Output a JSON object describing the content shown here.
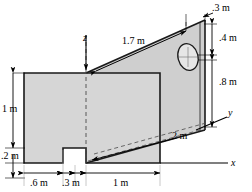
{
  "figure": {
    "type": "engineering-isometric-drawing",
    "colors": {
      "outline": "#1a1a1a",
      "face_fill": "#d5d5d5",
      "face_fill_right": "#cfcfcf",
      "background": "#ffffff",
      "dimension_line": "#000000"
    },
    "axes": [
      {
        "name": "x",
        "label": "x"
      },
      {
        "name": "y",
        "label": "y"
      },
      {
        "name": "z",
        "label": "z"
      }
    ],
    "dimensions": [
      {
        "id": "d-03-top",
        "label": ".3 m",
        "position": "top-right"
      },
      {
        "id": "d-04",
        "label": ".4 m",
        "position": "right-upper"
      },
      {
        "id": "d-08",
        "label": ".8 m",
        "position": "right-lower"
      },
      {
        "id": "d-17",
        "label": "1.7 m",
        "position": "top-slant"
      },
      {
        "id": "d-2",
        "label": "2 m",
        "position": "bottom-slant"
      },
      {
        "id": "d-1-vert",
        "label": "1 m",
        "position": "left-vertical"
      },
      {
        "id": "d-02",
        "label": ".2 m",
        "position": "left-bottom"
      },
      {
        "id": "d-06",
        "label": ".6 m",
        "position": "bottom-left"
      },
      {
        "id": "d-03-bottom",
        "label": ".3 m",
        "position": "bottom-middle"
      },
      {
        "id": "d-1-horiz",
        "label": "1 m",
        "position": "bottom-right"
      }
    ]
  }
}
